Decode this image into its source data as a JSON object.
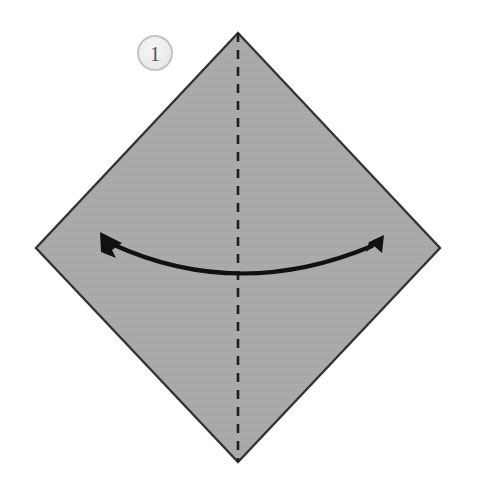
{
  "figure": {
    "background_color": "#ffffff",
    "canvas": {
      "width": 478,
      "height": 493
    }
  },
  "step_badge": {
    "label": "1",
    "shape": "circle",
    "center": {
      "x": 155,
      "y": 53
    },
    "radius": 17,
    "fill_color": "#ededee",
    "ring_color": "#c3c3c4",
    "text_color": "#55565a"
  },
  "paper": {
    "name": "square-sheet-rotated",
    "shape": "diamond",
    "fill_color": "#a9a9a9",
    "edge_color": "#3a3a3c",
    "edge_width": 2.4,
    "vertices": {
      "top": {
        "x": 238,
        "y": 33
      },
      "right": {
        "x": 440,
        "y": 248
      },
      "bottom": {
        "x": 238,
        "y": 462
      },
      "left": {
        "x": 36,
        "y": 248
      }
    }
  },
  "crease_line": {
    "name": "vertical-fold-crease",
    "style": "dashed",
    "meaning": "existing crease / fold axis",
    "color": "#1f1f21",
    "width": 2.6,
    "dash": "9 8",
    "from": {
      "x": 238,
      "y": 33
    },
    "to": {
      "x": 238,
      "y": 462
    }
  },
  "fold_arrow": {
    "name": "bring-together-arrow",
    "style": "double-headed curved arrow",
    "meaning": "fold left corner and right corner together",
    "color": "#111113",
    "width": 4.0,
    "left_tip": {
      "x": 100,
      "y": 232
    },
    "right_tip": {
      "x": 384,
      "y": 235
    },
    "lowest_point": {
      "x": 238,
      "y": 283
    },
    "arrowhead_length": 26
  },
  "colors": {
    "paper_gray": "#a9a9a9",
    "ink_black": "#111113",
    "edge_dark": "#3a3a3c",
    "badge_fill": "#ededee",
    "badge_ring": "#c3c3c4",
    "page_white": "#ffffff"
  }
}
